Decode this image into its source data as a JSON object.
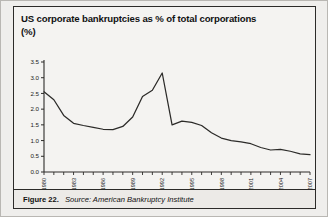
{
  "figure": {
    "title_line1": "US corporate bankruptcies as % of total corporations",
    "title_line2": "(%)",
    "caption_label": "Figure 22.",
    "caption_source": "Source: American Bankruptcy Institute",
    "line_color": "#2b2a28",
    "frame_color": "#2c2b29",
    "background_color": "#f4f3f1"
  },
  "chart_data": {
    "type": "line",
    "title": "US corporate bankruptcies as % of total corporations (%)",
    "xlabel": "",
    "ylabel": "(%)",
    "ylim": [
      0.0,
      3.5
    ],
    "xlim": [
      1980,
      2007
    ],
    "grid": false,
    "legend": "none",
    "ytick_labels": [
      "0.0",
      "0.5",
      "1.0",
      "1.5",
      "2.0",
      "2.5",
      "3.0",
      "3.5"
    ],
    "ytick_values": [
      0.0,
      0.5,
      1.0,
      1.5,
      2.0,
      2.5,
      3.0,
      3.5
    ],
    "xtick_labels": [
      "1980",
      "1983",
      "1986",
      "1989",
      "1992",
      "1995",
      "1998",
      "2001",
      "2004",
      "2007"
    ],
    "xtick_values": [
      1980,
      1983,
      1986,
      1989,
      1992,
      1995,
      1998,
      2001,
      2004,
      2007
    ],
    "x": [
      1980,
      1981,
      1982,
      1983,
      1984,
      1985,
      1986,
      1987,
      1988,
      1989,
      1990,
      1991,
      1992,
      1993,
      1994,
      1995,
      1996,
      1997,
      1998,
      1999,
      2000,
      2001,
      2002,
      2003,
      2004,
      2005,
      2006,
      2007
    ],
    "series": [
      {
        "name": "US corporate bankruptcies as % of total corporations",
        "color": "#2b2a28",
        "values": [
          2.55,
          2.3,
          1.8,
          1.55,
          1.48,
          1.42,
          1.36,
          1.35,
          1.45,
          1.75,
          2.4,
          2.6,
          3.15,
          1.5,
          1.62,
          1.58,
          1.48,
          1.25,
          1.08,
          1.0,
          0.96,
          0.9,
          0.78,
          0.7,
          0.72,
          0.66,
          0.58,
          0.55
        ]
      }
    ]
  }
}
